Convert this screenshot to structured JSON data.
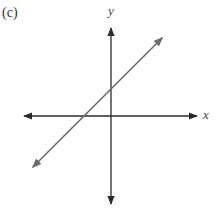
{
  "panel": {
    "label": "(c)"
  },
  "chart_data": {
    "type": "line",
    "title": "",
    "panel_label": "(c)",
    "xlabel": "x",
    "ylabel": "y",
    "grid": false,
    "ticks": false,
    "axes": {
      "x_arrows": "both",
      "y_arrows": "both"
    },
    "series": [
      {
        "name": "line",
        "description": "straight line with positive slope and positive y-intercept, arrows at both ends",
        "slope": 1,
        "y_intercept": 1,
        "x_intercept": -1,
        "x": [
          -2.9,
          1.9
        ],
        "y": [
          -1.9,
          2.9
        ]
      }
    ],
    "xlim": [
      -3.2,
      3.2
    ],
    "ylim": [
      -3.2,
      3.2
    ]
  },
  "colors": {
    "axes": "#2a2a2a",
    "line": "#6b6b6b",
    "text": "#333333"
  }
}
